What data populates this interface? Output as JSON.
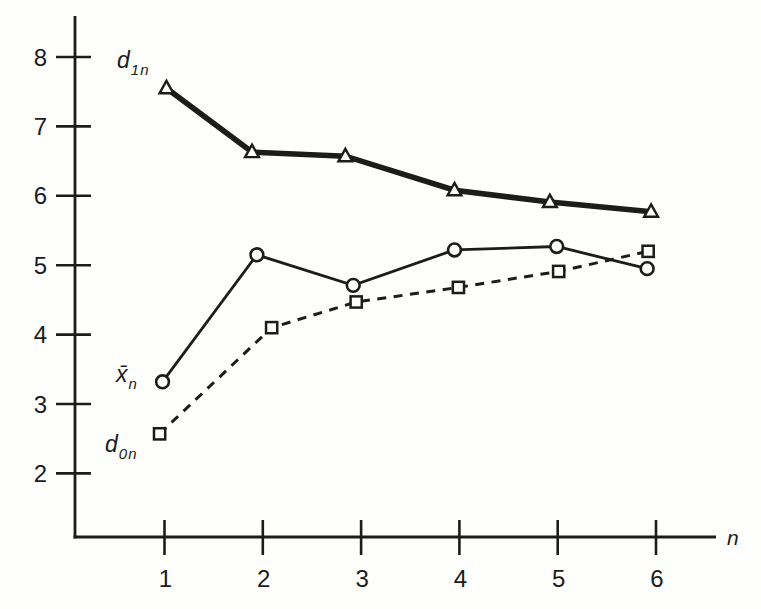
{
  "chart_data": {
    "type": "line",
    "title": "",
    "xlabel": "n",
    "ylabel": "",
    "x_ticks": [
      1,
      2,
      3,
      4,
      5,
      6
    ],
    "y_ticks": [
      2,
      3,
      4,
      5,
      6,
      7,
      8
    ],
    "xlim": [
      0.1,
      6.6
    ],
    "ylim": [
      1.05,
      8.6
    ],
    "grid": false,
    "legend_position": "labels-next-to-first-point",
    "background": "#fefefd",
    "ink": "#1c1c1c",
    "series": [
      {
        "name": "d1n",
        "label": {
          "main": "d",
          "sub": "1n"
        },
        "marker": "triangle",
        "line_style": "solid-thick",
        "x": [
          1.02,
          1.89,
          2.84,
          3.95,
          4.92,
          5.95
        ],
        "y": [
          7.55,
          6.63,
          6.57,
          6.08,
          5.91,
          5.77
        ]
      },
      {
        "name": "xbar_n",
        "label": {
          "main": "x̄",
          "sub": "n"
        },
        "marker": "circle",
        "line_style": "solid",
        "x": [
          0.98,
          1.94,
          2.92,
          3.95,
          4.99,
          5.91
        ],
        "y": [
          3.32,
          5.15,
          4.71,
          5.22,
          5.27,
          4.95
        ]
      },
      {
        "name": "d0n",
        "label": {
          "main": "d",
          "sub": "0n"
        },
        "marker": "square",
        "line_style": "dashed",
        "x": [
          0.95,
          2.09,
          2.95,
          3.99,
          5.01,
          5.92
        ],
        "y": [
          2.57,
          4.1,
          4.47,
          4.68,
          4.91,
          5.2
        ]
      }
    ]
  }
}
